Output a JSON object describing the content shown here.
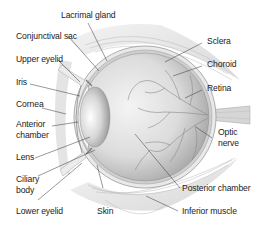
{
  "diagram": {
    "labels_left": [
      {
        "id": "lacrimal-gland",
        "text": "Lacrimal gland"
      },
      {
        "id": "conjunctival-sac",
        "text": "Conjunctival sac"
      },
      {
        "id": "upper-eyelid",
        "text": "Upper eyelid"
      },
      {
        "id": "iris",
        "text": "Iris"
      },
      {
        "id": "cornea",
        "text": "Cornea"
      },
      {
        "id": "anterior-chamber",
        "line1": "Anterior",
        "line2": "chamber"
      },
      {
        "id": "lens",
        "text": "Lens"
      },
      {
        "id": "ciliary-body",
        "line1": "Ciliary",
        "line2": "body"
      },
      {
        "id": "lower-eyelid",
        "text": "Lower eyelid"
      },
      {
        "id": "skin",
        "text": "Skin"
      }
    ],
    "labels_right": [
      {
        "id": "sclera",
        "text": "Sclera"
      },
      {
        "id": "choroid",
        "text": "Choroid"
      },
      {
        "id": "retina",
        "text": "Retina"
      },
      {
        "id": "optic-nerve",
        "line1": "Optic",
        "line2": "nerve"
      },
      {
        "id": "posterior-chamber",
        "text": "Posterior chamber"
      },
      {
        "id": "inferior-muscle",
        "text": "Inferior muscle"
      }
    ],
    "colors": {
      "text": "#222222",
      "leader": "#333333",
      "eyeball_light": "#f2f2f2",
      "eyeball_dark": "#a8a8a8",
      "vessels": "#8a8a8a",
      "tissue": "#cfcfcf"
    }
  }
}
